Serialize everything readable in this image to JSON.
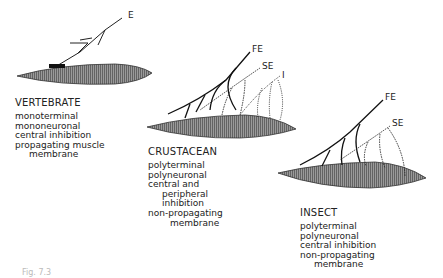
{
  "panels": {
    "vertebrate": {
      "title": "VERTEBRATE",
      "lines": [
        "monoterminal",
        "mononeuronal",
        "central  inhibition",
        "propagating  muscle",
        "membrane"
      ],
      "nerve_labels": [
        "E"
      ]
    },
    "crustacean": {
      "title": "CRUSTACEAN",
      "lines": [
        "polyterminal",
        "polyneuronal",
        "central  and",
        "peripheral",
        "inhibition",
        "non-propagating",
        "membrane"
      ],
      "nerve_labels": [
        "FE",
        "SE",
        "I"
      ]
    },
    "insect": {
      "title": "INSECT",
      "lines": [
        "polyterminal",
        "polyneuronal",
        "central  inhibition",
        "non-propagating",
        "membrane"
      ],
      "nerve_labels": [
        "FE",
        "SE"
      ]
    }
  },
  "caption": "Fig. 7.3"
}
